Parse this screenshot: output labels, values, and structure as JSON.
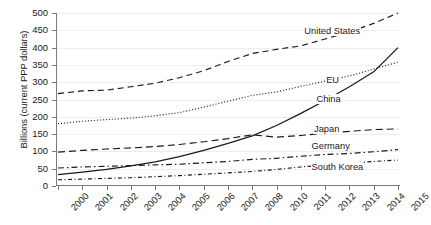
{
  "chart_data": {
    "type": "line",
    "title": "",
    "xlabel": "",
    "ylabel": "Billions (current PPP dollars)",
    "xlim": [
      2000,
      2015
    ],
    "ylim": [
      0,
      500
    ],
    "grid": true,
    "legend_position": "inline-labels",
    "x": [
      2000,
      2001,
      2002,
      2003,
      2004,
      2005,
      2006,
      2007,
      2008,
      2010,
      2011,
      2012,
      2013,
      2014,
      2015
    ],
    "xtick_labels": [
      "2000",
      "2001",
      "2002",
      "2003",
      "2004",
      "2005",
      "2006",
      "2007",
      "2008",
      "2010",
      "2011",
      "2012",
      "2013",
      "2014",
      "2015"
    ],
    "ytick_labels": [
      "0",
      "50",
      "100",
      "150",
      "200",
      "250",
      "300",
      "350",
      "400",
      "450",
      "500"
    ],
    "ytick_values": [
      0,
      50,
      100,
      150,
      200,
      250,
      300,
      350,
      400,
      450,
      500
    ],
    "series": [
      {
        "name": "United States",
        "dash": "long-dash",
        "values": [
          267,
          275,
          277,
          287,
          297,
          313,
          333,
          360,
          383,
          395,
          405,
          425,
          445,
          470,
          500
        ]
      },
      {
        "name": "EU",
        "dash": "dotted",
        "values": [
          180,
          187,
          192,
          196,
          203,
          212,
          228,
          245,
          262,
          272,
          288,
          303,
          318,
          338,
          358
        ]
      },
      {
        "name": "China",
        "dash": "solid",
        "values": [
          33,
          40,
          48,
          58,
          70,
          85,
          103,
          123,
          145,
          175,
          210,
          247,
          287,
          330,
          400
        ]
      },
      {
        "name": "Japan",
        "dash": "dashed",
        "values": [
          98,
          103,
          107,
          110,
          114,
          120,
          128,
          137,
          148,
          141,
          146,
          153,
          158,
          163,
          165
        ]
      },
      {
        "name": "Germany",
        "dash": "dash-dot",
        "values": [
          52,
          55,
          57,
          59,
          61,
          63,
          67,
          71,
          77,
          80,
          86,
          91,
          94,
          99,
          105
        ]
      },
      {
        "name": "South Korea",
        "dash": "dash-dot-fine",
        "values": [
          18,
          20,
          22,
          24,
          27,
          30,
          34,
          38,
          42,
          48,
          55,
          61,
          66,
          71,
          75
        ]
      }
    ],
    "annotations": [
      {
        "text": "United States",
        "x": 2011.1,
        "y": 445
      },
      {
        "text": "EU",
        "x": 2012.0,
        "y": 303
      },
      {
        "text": "China",
        "x": 2011.6,
        "y": 250
      },
      {
        "text": "Japan",
        "x": 2011.5,
        "y": 163
      },
      {
        "text": "Germany",
        "x": 2011.4,
        "y": 112
      },
      {
        "text": "South Korea",
        "x": 2011.4,
        "y": 52
      }
    ],
    "colors": {
      "line": "#1a1a1a",
      "axis": "#7a7a7a",
      "grid": "#ededed",
      "background": "#ffffff",
      "text": "#1a1a1a"
    }
  }
}
